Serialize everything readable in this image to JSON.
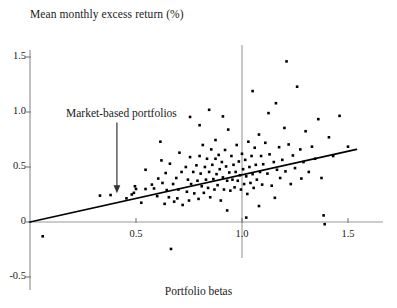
{
  "chart_data": {
    "type": "scatter",
    "title": "Mean monthly excess return (%)",
    "xlabel": "Portfolio betas",
    "ylabel": "Mean monthly excess return (%)",
    "xlim": [
      -0.05,
      1.72
    ],
    "ylim": [
      -0.62,
      1.72
    ],
    "xticks": [
      0.5,
      1.0,
      1.5
    ],
    "xtick_labels": [
      "0.5",
      "1.0",
      "1.5"
    ],
    "yticks": [
      1.5,
      1.0,
      0.5,
      0,
      -0.5
    ],
    "ytick_labels": [
      "1.5",
      "1.0",
      "0.5",
      "0",
      "-0.5"
    ],
    "grid": false,
    "legend": null,
    "annotations": [
      {
        "text": "Market-based portfolios",
        "x": 0.41,
        "y": 0.96,
        "arrow_to_x": 0.41,
        "arrow_to_y": 0.27,
        "arrow": "down"
      }
    ],
    "reference_lines": [
      {
        "name": "zero-return-axis",
        "orientation": "horizontal",
        "value": 0,
        "color": "#999999"
      },
      {
        "name": "market-beta-line",
        "orientation": "vertical",
        "value": 1.0,
        "color": "#999999"
      }
    ],
    "fit_line": {
      "name": "regression-line",
      "x0": 0.0,
      "y0": 0.0,
      "x1": 1.54,
      "y1": 0.66,
      "slope": 0.4286,
      "intercept": 0.0,
      "color": "#000000"
    },
    "marker": {
      "shape": "square",
      "size": 2.6,
      "color": "#000000"
    },
    "points": [
      [
        0.06,
        -0.13
      ],
      [
        0.33,
        0.24
      ],
      [
        0.38,
        0.245
      ],
      [
        0.455,
        0.215
      ],
      [
        0.48,
        0.25
      ],
      [
        0.49,
        0.265
      ],
      [
        0.495,
        0.325
      ],
      [
        0.5,
        0.3
      ],
      [
        0.525,
        0.175
      ],
      [
        0.545,
        0.3
      ],
      [
        0.575,
        0.34
      ],
      [
        0.585,
        0.305
      ],
      [
        0.6,
        0.235
      ],
      [
        0.605,
        0.395
      ],
      [
        0.625,
        0.355
      ],
      [
        0.635,
        0.165
      ],
      [
        0.64,
        0.445
      ],
      [
        0.645,
        0.29
      ],
      [
        0.655,
        0.225
      ],
      [
        0.66,
        0.53
      ],
      [
        0.665,
        -0.245
      ],
      [
        0.675,
        0.345
      ],
      [
        0.68,
        0.185
      ],
      [
        0.69,
        0.4
      ],
      [
        0.695,
        0.215
      ],
      [
        0.7,
        0.295
      ],
      [
        0.705,
        0.63
      ],
      [
        0.715,
        0.455
      ],
      [
        0.72,
        0.155
      ],
      [
        0.735,
        0.5
      ],
      [
        0.74,
        0.275
      ],
      [
        0.745,
        0.385
      ],
      [
        0.75,
        0.195
      ],
      [
        0.755,
        0.59
      ],
      [
        0.76,
        0.345
      ],
      [
        0.77,
        0.455
      ],
      [
        0.775,
        0.26
      ],
      [
        0.785,
        0.515
      ],
      [
        0.79,
        0.375
      ],
      [
        0.795,
        0.21
      ],
      [
        0.8,
        0.6
      ],
      [
        0.805,
        0.44
      ],
      [
        0.81,
        0.325
      ],
      [
        0.815,
        0.7
      ],
      [
        0.82,
        0.265
      ],
      [
        0.825,
        0.5
      ],
      [
        0.83,
        0.385
      ],
      [
        0.835,
        0.575
      ],
      [
        0.84,
        0.31
      ],
      [
        0.845,
        0.455
      ],
      [
        0.85,
        0.225
      ],
      [
        0.855,
        0.66
      ],
      [
        0.86,
        0.52
      ],
      [
        0.865,
        0.39
      ],
      [
        0.87,
        0.295
      ],
      [
        0.875,
        0.575
      ],
      [
        0.88,
        0.435
      ],
      [
        0.885,
        0.335
      ],
      [
        0.89,
        0.61
      ],
      [
        0.895,
        0.48
      ],
      [
        0.9,
        0.195
      ],
      [
        0.905,
        0.545
      ],
      [
        0.91,
        0.405
      ],
      [
        0.915,
        0.295
      ],
      [
        0.92,
        0.655
      ],
      [
        0.925,
        0.505
      ],
      [
        0.93,
        0.375
      ],
      [
        0.935,
        0.84
      ],
      [
        0.94,
        0.45
      ],
      [
        0.945,
        0.285
      ],
      [
        0.95,
        0.6
      ],
      [
        0.955,
        0.385
      ],
      [
        0.96,
        0.52
      ],
      [
        0.965,
        0.315
      ],
      [
        0.97,
        0.455
      ],
      [
        0.975,
        0.7
      ],
      [
        0.98,
        0.375
      ],
      [
        0.985,
        0.55
      ],
      [
        0.99,
        0.425
      ],
      [
        0.995,
        0.295
      ],
      [
        1.0,
        0.62
      ],
      [
        1.005,
        0.48
      ],
      [
        1.01,
        0.345
      ],
      [
        1.015,
        0.565
      ],
      [
        1.02,
        0.415
      ],
      [
        1.025,
        0.255
      ],
      [
        1.03,
        0.73
      ],
      [
        1.035,
        0.5
      ],
      [
        1.04,
        0.355
      ],
      [
        1.045,
        0.6
      ],
      [
        1.05,
        0.435
      ],
      [
        1.055,
        0.31
      ],
      [
        1.06,
        0.675
      ],
      [
        1.065,
        0.52
      ],
      [
        1.07,
        0.385
      ],
      [
        1.08,
        0.795
      ],
      [
        1.085,
        0.455
      ],
      [
        1.09,
        0.6
      ],
      [
        1.095,
        0.34
      ],
      [
        1.1,
        0.525
      ],
      [
        1.11,
        0.72
      ],
      [
        1.12,
        0.44
      ],
      [
        1.13,
        0.615
      ],
      [
        1.14,
        0.33
      ],
      [
        1.15,
        0.545
      ],
      [
        1.16,
        1.08
      ],
      [
        1.165,
        0.475
      ],
      [
        1.175,
        0.68
      ],
      [
        1.18,
        0.4
      ],
      [
        1.19,
        0.565
      ],
      [
        1.2,
        0.855
      ],
      [
        1.205,
        0.46
      ],
      [
        1.21,
        1.46
      ],
      [
        1.22,
        0.705
      ],
      [
        1.23,
        0.345
      ],
      [
        1.24,
        0.605
      ],
      [
        1.25,
        0.49
      ],
      [
        1.26,
        1.23
      ],
      [
        1.275,
        0.66
      ],
      [
        1.28,
        0.395
      ],
      [
        1.29,
        0.545
      ],
      [
        1.3,
        0.825
      ],
      [
        1.315,
        0.455
      ],
      [
        1.33,
        0.685
      ],
      [
        1.345,
        0.575
      ],
      [
        1.36,
        0.935
      ],
      [
        1.375,
        0.4
      ],
      [
        1.385,
        0.06
      ],
      [
        1.39,
        -0.02
      ],
      [
        1.41,
        0.77
      ],
      [
        1.43,
        0.6
      ],
      [
        1.46,
        0.965
      ],
      [
        1.5,
        0.685
      ],
      [
        0.845,
        1.02
      ],
      [
        0.91,
        0.96
      ],
      [
        0.755,
        0.955
      ],
      [
        1.05,
        1.19
      ],
      [
        1.125,
        0.99
      ],
      [
        0.8,
        0.88
      ],
      [
        0.875,
        0.745
      ],
      [
        0.615,
        0.73
      ],
      [
        0.93,
        0.105
      ],
      [
        1.02,
        0.04
      ],
      [
        1.08,
        0.145
      ],
      [
        1.155,
        0.22
      ],
      [
        0.545,
        0.475
      ],
      [
        0.62,
        0.56
      ]
    ]
  }
}
